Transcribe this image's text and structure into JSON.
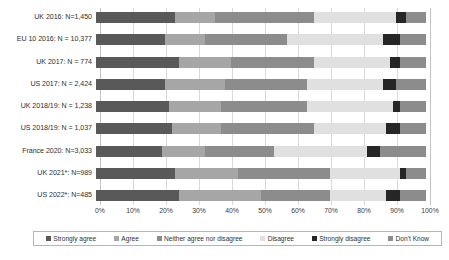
{
  "chart_data": {
    "type": "bar",
    "subtype": "stacked-horizontal-100percent",
    "title": "",
    "xlabel": "",
    "ylabel": "",
    "xlim": [
      0,
      100
    ],
    "grid": true,
    "legend_position": "bottom",
    "tick_labels": [
      "0%",
      "10%",
      "20%",
      "30%",
      "40%",
      "50%",
      "60%",
      "70%",
      "80%",
      "90%",
      "100%"
    ],
    "tick_values": [
      0,
      10,
      20,
      30,
      40,
      50,
      60,
      70,
      80,
      90,
      100
    ],
    "categories": [
      "UK 2016: N=1,450",
      "EU 10 2016: N = 10,377",
      "UK 2017: N = 774",
      "US 2017: N = 2,424",
      "UK 2018/19: N = 1,238",
      "US 2018/19: N = 1,037",
      "France 2020: N=3,033",
      "UK 2021*: N=989",
      "US 2022*: N=485"
    ],
    "series": [
      {
        "name": "Strongly agree",
        "color": "#595959",
        "values": [
          24,
          21,
          25,
          21,
          22,
          23,
          20,
          24,
          25
        ]
      },
      {
        "name": "Agree",
        "color": "#a6a6a6",
        "values": [
          12,
          12,
          16,
          18,
          16,
          15,
          13,
          19,
          25
        ]
      },
      {
        "name": "Neither agree nor disagree",
        "color": "#8c8c8c",
        "values": [
          30,
          25,
          25,
          25,
          26,
          28,
          21,
          28,
          21
        ]
      },
      {
        "name": "Disagree",
        "color": "#e0e0e0",
        "values": [
          25,
          29,
          23,
          23,
          26,
          22,
          28,
          21,
          17
        ]
      },
      {
        "name": "Strongly disagree",
        "color": "#262626",
        "values": [
          3,
          5,
          3,
          4,
          2,
          4,
          4,
          2,
          4
        ]
      },
      {
        "name": "Don't Know",
        "color": "#8c8c8c",
        "values": [
          6,
          8,
          8,
          9,
          8,
          8,
          14,
          6,
          8
        ]
      }
    ]
  },
  "legend": {
    "items": [
      {
        "label": "Strongly agree",
        "color": "#595959"
      },
      {
        "label": "Agree",
        "color": "#a6a6a6"
      },
      {
        "label": "Neither agree nor disagree",
        "color": "#8c8c8c"
      },
      {
        "label": "Disagree",
        "color": "#e0e0e0"
      },
      {
        "label": "Strongly disagree",
        "color": "#262626"
      },
      {
        "label": "Don't Know",
        "color": "#8c8c8c"
      }
    ]
  }
}
